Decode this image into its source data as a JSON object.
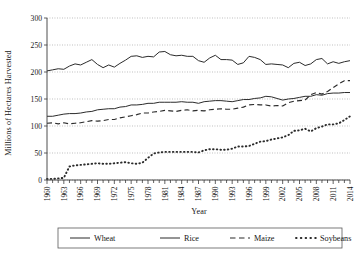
{
  "chart_data": {
    "type": "line",
    "title": "",
    "xlabel": "Year",
    "ylabel": "Millions of Hectares Harvested",
    "xlim": [
      1960,
      2014
    ],
    "ylim": [
      0,
      300
    ],
    "ytick_step": 50,
    "yticks": [
      0,
      50,
      100,
      150,
      200,
      250,
      300
    ],
    "xticks_labeled": [
      1960,
      1963,
      1966,
      1969,
      1972,
      1975,
      1978,
      1981,
      1984,
      1987,
      1990,
      1993,
      1996,
      1999,
      2002,
      2005,
      2008,
      2011,
      2014
    ],
    "xtick_every": 1,
    "xtick_label_every": 3,
    "grid": "horizontal-dotted",
    "legend_position": "below-plot",
    "x": [
      1960,
      1961,
      1962,
      1963,
      1964,
      1965,
      1966,
      1967,
      1968,
      1969,
      1970,
      1971,
      1972,
      1973,
      1974,
      1975,
      1976,
      1977,
      1978,
      1979,
      1980,
      1981,
      1982,
      1983,
      1984,
      1985,
      1986,
      1987,
      1988,
      1989,
      1990,
      1991,
      1992,
      1993,
      1994,
      1995,
      1996,
      1997,
      1998,
      1999,
      2000,
      2001,
      2002,
      2003,
      2004,
      2005,
      2006,
      2007,
      2008,
      2009,
      2010,
      2011,
      2012,
      2013,
      2014
    ],
    "series": [
      {
        "name": "Wheat",
        "style": "solid",
        "color": "#2b2b2b",
        "values": [
          202,
          204,
          206,
          205,
          211,
          215,
          213,
          218,
          223,
          214,
          208,
          213,
          209,
          216,
          222,
          229,
          230,
          227,
          229,
          228,
          237,
          238,
          232,
          230,
          231,
          229,
          229,
          221,
          218,
          226,
          231,
          223,
          223,
          222,
          214,
          217,
          229,
          227,
          223,
          214,
          215,
          214,
          213,
          208,
          216,
          218,
          212,
          215,
          223,
          225,
          215,
          219,
          216,
          219,
          221
        ]
      },
      {
        "name": "Rice",
        "style": "solid",
        "color": "#2b2b2b",
        "values": [
          118,
          118,
          120,
          122,
          123,
          123,
          124,
          126,
          127,
          130,
          131,
          132,
          132,
          135,
          136,
          139,
          139,
          140,
          142,
          142,
          144,
          144,
          144,
          144,
          145,
          144,
          144,
          142,
          145,
          146,
          147,
          147,
          146,
          145,
          147,
          149,
          149,
          151,
          152,
          155,
          154,
          151,
          148,
          150,
          151,
          153,
          155,
          155,
          158,
          157,
          160,
          161,
          161,
          162,
          162
        ]
      },
      {
        "name": "Maize",
        "style": "dashed",
        "color": "#2b2b2b",
        "values": [
          105,
          106,
          104,
          106,
          104,
          105,
          106,
          108,
          110,
          109,
          110,
          112,
          112,
          115,
          117,
          119,
          121,
          124,
          124,
          126,
          127,
          129,
          128,
          127,
          129,
          130,
          128,
          129,
          128,
          130,
          131,
          132,
          131,
          131,
          133,
          135,
          139,
          140,
          139,
          139,
          137,
          138,
          137,
          143,
          146,
          147,
          148,
          158,
          162,
          159,
          164,
          171,
          178,
          184,
          184
        ]
      },
      {
        "name": "Soybeans",
        "style": "dotted",
        "color": "#1a1a1a",
        "values": [
          2,
          2,
          3,
          4,
          25,
          27,
          28,
          29,
          30,
          31,
          30,
          30,
          31,
          32,
          33,
          31,
          30,
          32,
          41,
          49,
          51,
          52,
          52,
          52,
          52,
          52,
          52,
          51,
          55,
          57,
          57,
          56,
          56,
          58,
          62,
          62,
          63,
          67,
          71,
          72,
          75,
          77,
          79,
          83,
          91,
          92,
          95,
          90,
          96,
          99,
          103,
          103,
          105,
          111,
          118
        ]
      }
    ]
  },
  "legend": {
    "items": [
      {
        "label": "Wheat",
        "style": "solid"
      },
      {
        "label": "Rice",
        "style": "solid"
      },
      {
        "label": "Maize",
        "style": "dashed"
      },
      {
        "label": "Soybeans",
        "style": "dotted"
      }
    ]
  }
}
